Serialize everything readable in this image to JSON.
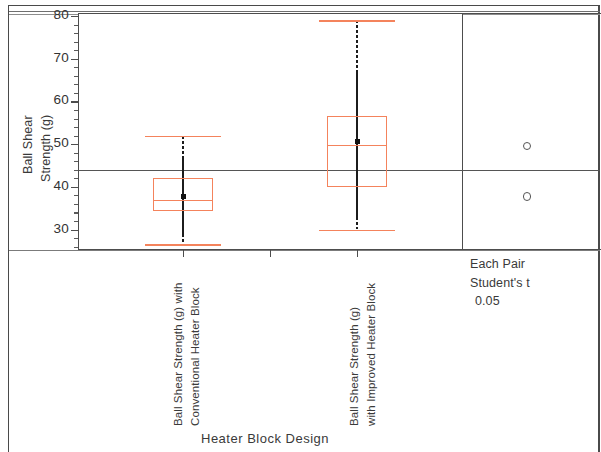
{
  "chart_data": {
    "type": "box",
    "title": "",
    "xlabel": "Heater Block Design",
    "ylabel": "Ball Shear Strength (g)",
    "ylabel_line1": "Ball Shear",
    "ylabel_line2": "Strength (g)",
    "ylim": [
      26,
      80
    ],
    "yticks": [
      30,
      40,
      50,
      60,
      70,
      80
    ],
    "ytick_labels": [
      "30",
      "40",
      "50",
      "60",
      "70",
      "80"
    ],
    "minor_ticks_per_interval": 4,
    "grid": false,
    "legend": "none",
    "grand_mean": 43.5,
    "grand_mean_label": "",
    "categories": [
      "Ball Shear Strength (g) with Conventional Heater Block",
      "Ball Shear Strength (g) with Improved Heater Block"
    ],
    "category_label_lines": [
      [
        "Ball Shear Strength (g) with",
        "Conventional Heater Block"
      ],
      [
        "Ball Shear Strength (g)",
        "with Improved Heater Block"
      ]
    ],
    "series": [
      {
        "name": "Ball Shear Strength (g) with Conventional Heater Block",
        "upper_whisker": 52.0,
        "q3": 42.0,
        "median": 37.0,
        "q1": 34.3,
        "lower_whisker": 26.5,
        "mean": 37.8
      },
      {
        "name": "Ball Shear Strength (g) with Improved Heater Block",
        "upper_whisker": 79.0,
        "q3": 56.5,
        "median": 49.8,
        "q1": 40.0,
        "lower_whisker": 30.0,
        "mean": 50.7
      }
    ],
    "comparison_circles": {
      "method_line1": "Each Pair",
      "method_line2": "Student's t",
      "alpha": "0.05",
      "circles": [
        {
          "center": 49.8,
          "radius_px": 3.0
        },
        {
          "center": 38.0,
          "radius_px": 3.4
        }
      ]
    }
  },
  "axis": {
    "y_title_line1": "Ball Shear",
    "y_title_line2": "Strength (g)",
    "x_title": "Heater Block Design"
  },
  "comparison_panel": {
    "line1": "Each Pair",
    "line2": "Student's t",
    "line3": "0.05"
  },
  "colors": {
    "box_outline": "#F4835C",
    "spine": "#1C1C1C",
    "frame": "#4D4D4D",
    "text": "#3A3A3A",
    "mean_line": "#555555"
  }
}
